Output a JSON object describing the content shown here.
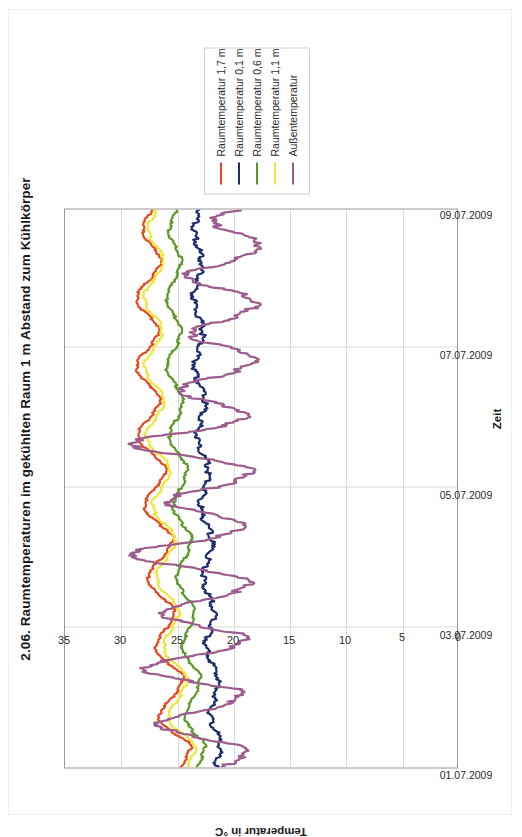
{
  "page": {
    "title": "2.06. Raumtemperaturen im gekühlten Raum 1 m Abstand zum Kühlkörper"
  },
  "chart_data": {
    "type": "line",
    "title": "2.06. Raumtemperaturen im gekühlten Raum 1 m Abstand zum Kühlkörper",
    "xlabel": "Zeit",
    "ylabel": "Temperatur in °C",
    "orientation": "rotated-90-ccw",
    "grid": true,
    "legend_position": "outside-right",
    "xlim": [
      0,
      8
    ],
    "ylim": [
      0,
      35
    ],
    "yticks": [
      0,
      5,
      10,
      15,
      20,
      25,
      30,
      35
    ],
    "ytick_labels": [
      "0",
      "5",
      "10",
      "15",
      "20",
      "25",
      "30",
      "35"
    ],
    "xticks": [
      0,
      2,
      4,
      6,
      8
    ],
    "xtick_labels": [
      "01.07.2009",
      "03.07.2009",
      "05.07.2009",
      "07.07.2009",
      "09.07.2009"
    ],
    "colors": {
      "raumtemperatur_1_7": "#E8481C",
      "raumtemperatur_0_1": "#1F2D6E",
      "raumtemperatur_0_6": "#5B9A26",
      "raumtemperatur_1_1": "#EDE83A",
      "aussentemperatur": "#9C5C8C"
    },
    "series": [
      {
        "name": "Raumtemperatur 1,7 m",
        "color": "#E8481C",
        "x": [
          0.0,
          0.1,
          0.2,
          0.3,
          0.4,
          0.5,
          0.6,
          0.7,
          0.8,
          0.9,
          1.0,
          1.1,
          1.2,
          1.3,
          1.4,
          1.5,
          1.6,
          1.7,
          1.8,
          1.9,
          2.0,
          2.1,
          2.2,
          2.3,
          2.4,
          2.5,
          2.6,
          2.7,
          2.8,
          2.9,
          3.0,
          3.1,
          3.2,
          3.3,
          3.4,
          3.5,
          3.6,
          3.7,
          3.8,
          3.9,
          4.0,
          4.1,
          4.2,
          4.3,
          4.4,
          4.5,
          4.6,
          4.7,
          4.8,
          4.9,
          5.0,
          5.1,
          5.2,
          5.3,
          5.4,
          5.5,
          5.6,
          5.7,
          5.8,
          5.9,
          6.0,
          6.1,
          6.2,
          6.3,
          6.4,
          6.5,
          6.6,
          6.7,
          6.8,
          6.9,
          7.0,
          7.1,
          7.2,
          7.3,
          7.4,
          7.5,
          7.6,
          7.7,
          7.8,
          7.9,
          8.0
        ],
        "y": [
          24.7,
          24.3,
          24.0,
          23.7,
          24.2,
          25.4,
          26.2,
          26.6,
          26.5,
          26.0,
          25.4,
          25.0,
          24.6,
          24.4,
          24.9,
          25.9,
          26.6,
          26.9,
          26.8,
          26.4,
          25.9,
          25.5,
          25.2,
          25.4,
          26.0,
          26.8,
          27.4,
          27.6,
          27.5,
          27.0,
          26.4,
          25.9,
          25.5,
          25.3,
          25.8,
          26.7,
          27.4,
          27.8,
          27.9,
          27.5,
          27.0,
          26.5,
          26.1,
          26.0,
          26.5,
          27.3,
          28.0,
          28.4,
          28.5,
          28.1,
          27.5,
          27.0,
          26.6,
          26.5,
          26.9,
          27.6,
          28.2,
          28.6,
          28.6,
          28.2,
          27.6,
          27.1,
          26.7,
          26.6,
          27.0,
          27.7,
          28.3,
          28.6,
          28.5,
          28.0,
          27.4,
          26.9,
          26.5,
          26.4,
          26.8,
          27.4,
          27.9,
          28.1,
          28.0,
          27.6,
          27.2
        ]
      },
      {
        "name": "Raumtemperatur 0,1 m",
        "color": "#1F2D6E",
        "x": [
          0.0,
          0.1,
          0.2,
          0.3,
          0.4,
          0.5,
          0.6,
          0.7,
          0.8,
          0.9,
          1.0,
          1.1,
          1.2,
          1.3,
          1.4,
          1.5,
          1.6,
          1.7,
          1.8,
          1.9,
          2.0,
          2.1,
          2.2,
          2.3,
          2.4,
          2.5,
          2.6,
          2.7,
          2.8,
          2.9,
          3.0,
          3.1,
          3.2,
          3.3,
          3.4,
          3.5,
          3.6,
          3.7,
          3.8,
          3.9,
          4.0,
          4.1,
          4.2,
          4.3,
          4.4,
          4.5,
          4.6,
          4.7,
          4.8,
          4.9,
          5.0,
          5.1,
          5.2,
          5.3,
          5.4,
          5.5,
          5.6,
          5.7,
          5.8,
          5.9,
          6.0,
          6.1,
          6.2,
          6.3,
          6.4,
          6.5,
          6.6,
          6.7,
          6.8,
          6.9,
          7.0,
          7.1,
          7.2,
          7.3,
          7.4,
          7.5,
          7.6,
          7.7,
          7.8,
          7.9,
          8.0
        ],
        "y": [
          21.6,
          21.4,
          21.2,
          21.1,
          21.2,
          21.5,
          21.8,
          22.0,
          22.0,
          21.8,
          21.6,
          21.4,
          21.3,
          21.3,
          21.5,
          21.9,
          22.2,
          22.4,
          22.4,
          22.2,
          22.0,
          21.8,
          21.7,
          21.8,
          22.0,
          22.3,
          22.5,
          22.6,
          22.6,
          22.4,
          22.2,
          22.0,
          21.9,
          21.9,
          22.1,
          22.4,
          22.7,
          22.9,
          22.9,
          22.7,
          22.5,
          22.3,
          22.2,
          22.2,
          22.4,
          22.7,
          23.0,
          23.2,
          23.2,
          23.0,
          22.8,
          22.6,
          22.5,
          22.5,
          22.7,
          23.0,
          23.3,
          23.4,
          23.4,
          23.2,
          23.0,
          22.8,
          22.7,
          22.7,
          22.9,
          23.2,
          23.4,
          23.5,
          23.5,
          23.3,
          23.1,
          22.9,
          22.8,
          22.8,
          23.0,
          23.2,
          23.4,
          23.5,
          23.4,
          23.2,
          23.0
        ]
      },
      {
        "name": "Raumtemperatur 0,6 m",
        "color": "#5B9A26",
        "x": [
          0.0,
          0.1,
          0.2,
          0.3,
          0.4,
          0.5,
          0.6,
          0.7,
          0.8,
          0.9,
          1.0,
          1.1,
          1.2,
          1.3,
          1.4,
          1.5,
          1.6,
          1.7,
          1.8,
          1.9,
          2.0,
          2.1,
          2.2,
          2.3,
          2.4,
          2.5,
          2.6,
          2.7,
          2.8,
          2.9,
          3.0,
          3.1,
          3.2,
          3.3,
          3.4,
          3.5,
          3.6,
          3.7,
          3.8,
          3.9,
          4.0,
          4.1,
          4.2,
          4.3,
          4.4,
          4.5,
          4.6,
          4.7,
          4.8,
          4.9,
          5.0,
          5.1,
          5.2,
          5.3,
          5.4,
          5.5,
          5.6,
          5.7,
          5.8,
          5.9,
          6.0,
          6.1,
          6.2,
          6.3,
          6.4,
          6.5,
          6.6,
          6.7,
          6.8,
          6.9,
          7.0,
          7.1,
          7.2,
          7.3,
          7.4,
          7.5,
          7.6,
          7.7,
          7.8,
          7.9,
          8.0
        ],
        "y": [
          23.2,
          22.9,
          22.7,
          22.5,
          22.8,
          23.5,
          24.0,
          24.3,
          24.2,
          23.9,
          23.5,
          23.2,
          23.0,
          22.9,
          23.2,
          23.8,
          24.3,
          24.5,
          24.5,
          24.2,
          23.9,
          23.6,
          23.4,
          23.5,
          23.9,
          24.4,
          24.8,
          25.0,
          25.0,
          24.7,
          24.3,
          24.0,
          23.8,
          23.7,
          24.0,
          24.6,
          25.0,
          25.3,
          25.3,
          25.0,
          24.7,
          24.4,
          24.2,
          24.1,
          24.4,
          24.9,
          25.4,
          25.6,
          25.7,
          25.4,
          25.0,
          24.7,
          24.5,
          24.5,
          24.8,
          25.2,
          25.6,
          25.9,
          25.9,
          25.6,
          25.2,
          24.9,
          24.7,
          24.6,
          24.9,
          25.4,
          25.7,
          25.9,
          25.9,
          25.5,
          25.2,
          24.9,
          24.7,
          24.6,
          24.9,
          25.3,
          25.6,
          25.7,
          25.6,
          25.3,
          25.0
        ]
      },
      {
        "name": "Raumtemperatur 1,1 m",
        "color": "#EDE83A",
        "x": [
          0.0,
          0.1,
          0.2,
          0.3,
          0.4,
          0.5,
          0.6,
          0.7,
          0.8,
          0.9,
          1.0,
          1.1,
          1.2,
          1.3,
          1.4,
          1.5,
          1.6,
          1.7,
          1.8,
          1.9,
          2.0,
          2.1,
          2.2,
          2.3,
          2.4,
          2.5,
          2.6,
          2.7,
          2.8,
          2.9,
          3.0,
          3.1,
          3.2,
          3.3,
          3.4,
          3.5,
          3.6,
          3.7,
          3.8,
          3.9,
          4.0,
          4.1,
          4.2,
          4.3,
          4.4,
          4.5,
          4.6,
          4.7,
          4.8,
          4.9,
          5.0,
          5.1,
          5.2,
          5.3,
          5.4,
          5.5,
          5.6,
          5.7,
          5.8,
          5.9,
          6.0,
          6.1,
          6.2,
          6.3,
          6.4,
          6.5,
          6.6,
          6.7,
          6.8,
          6.9,
          7.0,
          7.1,
          7.2,
          7.3,
          7.4,
          7.5,
          7.6,
          7.7,
          7.8,
          7.9,
          8.0
        ],
        "y": [
          24.1,
          23.8,
          23.5,
          23.3,
          23.7,
          24.7,
          25.4,
          25.8,
          25.7,
          25.3,
          24.8,
          24.5,
          24.2,
          24.1,
          24.5,
          25.3,
          25.9,
          26.2,
          26.1,
          25.8,
          25.4,
          25.1,
          24.8,
          24.9,
          25.4,
          26.1,
          26.6,
          26.8,
          26.8,
          26.4,
          25.9,
          25.5,
          25.2,
          25.1,
          25.5,
          26.2,
          26.8,
          27.1,
          27.2,
          26.8,
          26.4,
          26.0,
          25.7,
          25.6,
          26.0,
          26.7,
          27.3,
          27.7,
          27.8,
          27.4,
          26.9,
          26.5,
          26.2,
          26.1,
          26.5,
          27.1,
          27.6,
          27.9,
          27.9,
          27.6,
          27.1,
          26.7,
          26.4,
          26.3,
          26.6,
          27.2,
          27.7,
          27.9,
          27.9,
          27.5,
          27.0,
          26.6,
          26.3,
          26.2,
          26.5,
          27.0,
          27.4,
          27.6,
          27.5,
          27.1,
          26.8
        ]
      },
      {
        "name": "Außentemperatur",
        "color": "#9C5C8C",
        "x": [
          0.0,
          0.08,
          0.16,
          0.24,
          0.32,
          0.4,
          0.48,
          0.56,
          0.64,
          0.72,
          0.8,
          0.88,
          0.96,
          1.04,
          1.12,
          1.2,
          1.28,
          1.36,
          1.44,
          1.52,
          1.6,
          1.68,
          1.76,
          1.84,
          1.92,
          2.0,
          2.08,
          2.16,
          2.24,
          2.32,
          2.4,
          2.48,
          2.56,
          2.64,
          2.72,
          2.8,
          2.88,
          2.96,
          3.04,
          3.12,
          3.2,
          3.28,
          3.36,
          3.44,
          3.52,
          3.6,
          3.68,
          3.76,
          3.84,
          3.92,
          4.0,
          4.08,
          4.16,
          4.24,
          4.32,
          4.4,
          4.48,
          4.56,
          4.64,
          4.72,
          4.8,
          4.88,
          4.96,
          5.04,
          5.12,
          5.2,
          5.28,
          5.36,
          5.44,
          5.52,
          5.6,
          5.68,
          5.76,
          5.84,
          5.92,
          6.0,
          6.08,
          6.16,
          6.24,
          6.32,
          6.4,
          6.48,
          6.56,
          6.64,
          6.72,
          6.8,
          6.88,
          6.96,
          7.04,
          7.12,
          7.2,
          7.28,
          7.36,
          7.44,
          7.52,
          7.6,
          7.68,
          7.76,
          7.84,
          7.92,
          8.0
        ],
        "y": [
          21.0,
          20.0,
          19.0,
          18.6,
          19.5,
          22.0,
          24.5,
          26.2,
          26.8,
          25.5,
          23.0,
          21.0,
          19.8,
          19.2,
          19.6,
          22.5,
          25.5,
          27.5,
          28.0,
          26.5,
          23.5,
          21.0,
          19.5,
          18.8,
          19.4,
          22.0,
          24.5,
          26.0,
          26.5,
          25.0,
          22.5,
          20.5,
          19.2,
          18.5,
          19.0,
          21.5,
          24.5,
          27.5,
          29.5,
          28.5,
          25.0,
          22.0,
          20.0,
          19.0,
          19.2,
          21.0,
          23.5,
          25.5,
          26.0,
          24.5,
          22.0,
          20.0,
          19.0,
          18.4,
          18.8,
          21.5,
          25.0,
          28.0,
          29.5,
          28.0,
          24.5,
          21.5,
          19.5,
          18.8,
          19.2,
          21.0,
          23.0,
          24.5,
          24.8,
          23.5,
          21.5,
          19.8,
          18.6,
          18.0,
          18.4,
          20.0,
          22.0,
          23.5,
          24.0,
          23.0,
          21.0,
          19.5,
          18.5,
          18.0,
          18.2,
          19.5,
          21.5,
          23.5,
          24.5,
          23.5,
          21.5,
          19.8,
          18.5,
          17.8,
          17.5,
          18.5,
          20.0,
          21.5,
          22.0,
          21.0,
          19.5
        ]
      }
    ]
  },
  "legend": {
    "items": [
      {
        "label": "Raumtemperatur 1,7 m",
        "color": "#E8481C"
      },
      {
        "label": "Raumtemperatur 0,1 m",
        "color": "#1F2D6E"
      },
      {
        "label": "Raumtemperatur 0,6 m",
        "color": "#5B9A26"
      },
      {
        "label": "Raumtemperatur 1,1 m",
        "color": "#EDE83A"
      },
      {
        "label": "Außentemperatur",
        "color": "#9C5C8C"
      }
    ]
  }
}
